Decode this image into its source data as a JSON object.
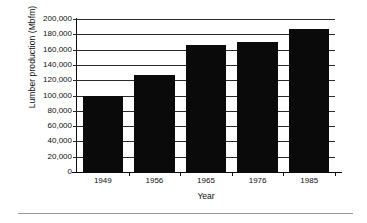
{
  "chart_data": {
    "type": "bar",
    "title": "",
    "categories": [
      "1949",
      "1956",
      "1965",
      "1976",
      "1985"
    ],
    "values": [
      99000,
      127000,
      165500,
      170500,
      187000
    ],
    "xlabel": "Year",
    "ylabel": "Lumber production (Mbfm)",
    "ylim": [
      0,
      200000
    ],
    "ytick_labels": [
      "200,000",
      "180,000",
      "160,000",
      "140,000",
      "120,000",
      "100,000",
      "80,000",
      "60,000",
      "40,000",
      "20,000",
      "0"
    ],
    "ytick_values": [
      200000,
      180000,
      160000,
      140000,
      120000,
      100000,
      80000,
      60000,
      40000,
      20000,
      0
    ],
    "grid": true,
    "legend": "none",
    "series_color": "#0a0a0a",
    "axis_color": "#0b0b0b",
    "grid_color": "#2a2a2a"
  }
}
